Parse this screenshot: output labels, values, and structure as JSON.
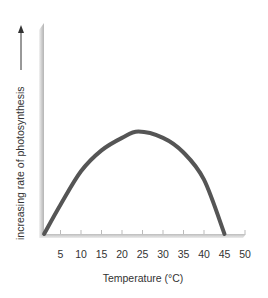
{
  "chart_data": {
    "type": "line",
    "title": "",
    "xlabel": "Temperature (°C)",
    "ylabel": "increasing rate of photosynthesis",
    "xlim": [
      0,
      50
    ],
    "ylim": [
      0,
      100
    ],
    "x_ticks": [
      5,
      10,
      15,
      20,
      25,
      30,
      35,
      40,
      45,
      50
    ],
    "y_ticks": [],
    "grid": false,
    "legend": null,
    "series": [
      {
        "name": "rate of photosynthesis",
        "color": "#555555",
        "x": [
          1,
          5,
          10,
          15,
          20,
          24,
          30,
          35,
          40,
          45
        ],
        "values": [
          0,
          14,
          30,
          40,
          46,
          49,
          46,
          39,
          26,
          0
        ]
      }
    ]
  },
  "colors": {
    "curve": "#555555",
    "axis": "#cccccc",
    "text": "#333333"
  }
}
